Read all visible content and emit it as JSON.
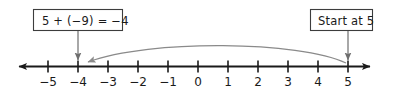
{
  "figure": {
    "callouts": [
      {
        "id": "equation-callout",
        "text": "5 + (−9) = −4",
        "points_to": -4
      },
      {
        "id": "start-callout",
        "text": "Start at 5",
        "points_to": 5
      }
    ],
    "number_line": {
      "ticks": [
        -5,
        -4,
        -3,
        -2,
        -1,
        0,
        1,
        2,
        3,
        4,
        5
      ],
      "tick_labels": [
        "−5",
        "−4",
        "−3",
        "−2",
        "−1",
        "0",
        "1",
        "2",
        "3",
        "4",
        "5"
      ],
      "min_shown": -5,
      "max_shown": 5,
      "arrow_left": true,
      "arrow_right": true
    },
    "jump": {
      "from": 5,
      "to": -4,
      "amount": -9,
      "direction": "left"
    },
    "colors": {
      "axis": "#1a1a1a",
      "box_border": "#3d3d3d",
      "leader": "#6e6e6e",
      "arc": "#8a8a8a",
      "text": "#1a1a1a",
      "background": "#ffffff"
    }
  }
}
